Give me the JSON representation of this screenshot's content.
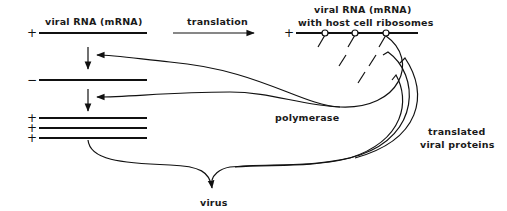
{
  "diagram": {
    "title_left": "viral RNA (mRNA)",
    "arrow_label": "translation",
    "title_right_line1": "viral RNA (mRNA)",
    "title_right_line2": "with host cell ribosomes",
    "plus_sign": "+",
    "minus_sign": "−",
    "polymerase_label": "polymerase",
    "proteins_label_line1": "translated",
    "proteins_label_line2": "viral proteins",
    "virus_label": "virus",
    "ribosome_count": 3,
    "progeny_plus_strands": 3
  }
}
